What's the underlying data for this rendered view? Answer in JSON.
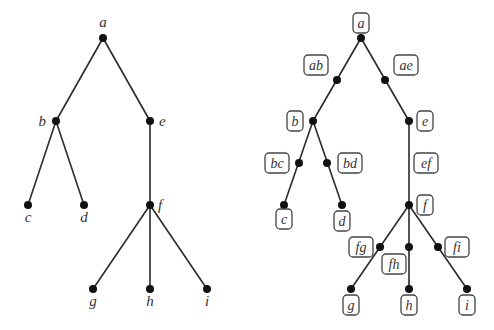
{
  "left_tree": {
    "nodes": [
      {
        "id": "a",
        "label": "a",
        "x": 103,
        "y": 38,
        "lx": 103,
        "ly": 27,
        "anchor": "middle"
      },
      {
        "id": "b",
        "label": "b",
        "x": 56,
        "y": 121,
        "lx": 46,
        "ly": 126,
        "anchor": "end"
      },
      {
        "id": "e",
        "label": "e",
        "x": 150,
        "y": 121,
        "lx": 159,
        "ly": 126,
        "anchor": "start"
      },
      {
        "id": "c",
        "label": "c",
        "x": 28,
        "y": 205,
        "lx": 28,
        "ly": 222,
        "anchor": "middle"
      },
      {
        "id": "d",
        "label": "d",
        "x": 84,
        "y": 205,
        "lx": 84,
        "ly": 222,
        "anchor": "middle"
      },
      {
        "id": "f",
        "label": "f",
        "x": 150,
        "y": 205,
        "lx": 158,
        "ly": 210,
        "anchor": "start"
      },
      {
        "id": "g",
        "label": "g",
        "x": 93,
        "y": 289,
        "lx": 93,
        "ly": 306,
        "anchor": "middle"
      },
      {
        "id": "h",
        "label": "h",
        "x": 150,
        "y": 289,
        "lx": 150,
        "ly": 306,
        "anchor": "middle"
      },
      {
        "id": "i",
        "label": "i",
        "x": 207,
        "y": 289,
        "lx": 207,
        "ly": 306,
        "anchor": "middle"
      }
    ],
    "edges": [
      [
        "a",
        "b"
      ],
      [
        "a",
        "e"
      ],
      [
        "b",
        "c"
      ],
      [
        "b",
        "d"
      ],
      [
        "e",
        "f"
      ],
      [
        "f",
        "g"
      ],
      [
        "f",
        "h"
      ],
      [
        "f",
        "i"
      ]
    ]
  },
  "right_tree": {
    "nodes": [
      {
        "id": "a",
        "label": "a",
        "x": 361,
        "y": 38,
        "bx": 361,
        "by": 23
      },
      {
        "id": "ab",
        "label": "ab",
        "x": 337,
        "y": 80,
        "bx": 316,
        "by": 65
      },
      {
        "id": "ae",
        "label": "ae",
        "x": 385,
        "y": 80,
        "bx": 406,
        "by": 65
      },
      {
        "id": "b",
        "label": "b",
        "x": 313,
        "y": 121,
        "bx": 295,
        "by": 121
      },
      {
        "id": "e",
        "label": "e",
        "x": 409,
        "y": 121,
        "bx": 425,
        "by": 121
      },
      {
        "id": "bc",
        "label": "bc",
        "x": 299,
        "y": 163,
        "bx": 277,
        "by": 163
      },
      {
        "id": "bd",
        "label": "bd",
        "x": 327,
        "y": 163,
        "bx": 350,
        "by": 163
      },
      {
        "id": "c",
        "label": "c",
        "x": 284,
        "y": 205,
        "bx": 284,
        "by": 219
      },
      {
        "id": "d",
        "label": "d",
        "x": 342,
        "y": 205,
        "bx": 342,
        "by": 221
      },
      {
        "id": "ef",
        "label": "ef",
        "x": 409,
        "y": 163,
        "bx": 426,
        "by": 163
      },
      {
        "id": "f",
        "label": "f",
        "x": 409,
        "y": 205,
        "bx": 425,
        "by": 205
      },
      {
        "id": "fg",
        "label": "fg",
        "x": 380,
        "y": 247,
        "bx": 361,
        "by": 247
      },
      {
        "id": "fh",
        "label": "fh",
        "x": 409,
        "y": 247,
        "bx": 394,
        "by": 264
      },
      {
        "id": "fi",
        "label": "fi",
        "x": 438,
        "y": 247,
        "bx": 457,
        "by": 247
      },
      {
        "id": "g",
        "label": "g",
        "x": 351,
        "y": 289,
        "bx": 351,
        "by": 305
      },
      {
        "id": "h",
        "label": "h",
        "x": 409,
        "y": 289,
        "bx": 409,
        "by": 305
      },
      {
        "id": "i",
        "label": "i",
        "x": 467,
        "y": 289,
        "bx": 467,
        "by": 305
      }
    ],
    "dots": [
      "a",
      "ab",
      "ae",
      "b",
      "e",
      "bc",
      "bd",
      "c",
      "d",
      "f",
      "fg",
      "fh",
      "fi",
      "g",
      "h",
      "i"
    ],
    "edges": [
      [
        "a",
        "b"
      ],
      [
        "a",
        "e"
      ],
      [
        "b",
        "c"
      ],
      [
        "b",
        "d"
      ],
      [
        "e",
        "f"
      ],
      [
        "f",
        "g"
      ],
      [
        "f",
        "h"
      ],
      [
        "f",
        "i"
      ]
    ]
  }
}
